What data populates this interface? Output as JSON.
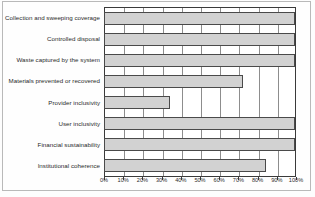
{
  "chart_data": {
    "type": "bar",
    "orientation": "horizontal",
    "title": "",
    "subtitle": "",
    "xlabel": "",
    "ylabel": "",
    "categories": [
      "Collection and sweeping coverage",
      "Controlled disposal",
      "Waste captured by the system",
      "Materials prevented or recovered",
      "Provider inclusivity",
      "User inclusivity",
      "Financial sustainability",
      "Institutional coherence"
    ],
    "values": [
      100,
      100,
      100,
      72,
      34,
      100,
      100,
      84
    ],
    "value_unit": "%",
    "xlim": [
      0,
      100
    ],
    "tick_labels": [
      "0%",
      "10%",
      "20%",
      "30%",
      "40%",
      "50%",
      "60%",
      "70%",
      "80%",
      "90%",
      "100%"
    ],
    "tick_values": [
      0,
      10,
      20,
      30,
      40,
      50,
      60,
      70,
      80,
      90,
      100
    ],
    "grid": true,
    "grid_axis": "x",
    "legend": false,
    "legend_position": "none",
    "annotations": [],
    "colors": {
      "bar_fill": "#d2d2d2",
      "bar_border": "#4a4a4a",
      "gridline": "#8d8d8d",
      "axis": "#3a3a3a",
      "text": "#2a2a2a",
      "background": "#ffffff",
      "frame": "#b9b9b9"
    }
  }
}
